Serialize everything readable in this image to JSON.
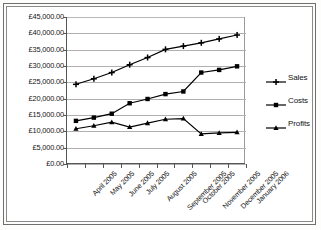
{
  "chart_data": {
    "type": "line",
    "title": "",
    "xlabel": "",
    "ylabel": "",
    "ylim": [
      0,
      45000
    ],
    "ytick_step": 5000,
    "grid": true,
    "legend_position": "right",
    "currency_symbol": "£",
    "categories": [
      "April 2005",
      "May 2005",
      "June 2005",
      "July 2005",
      "August 2005",
      "September 2005",
      "October 2005",
      "November 2005",
      "December 2005",
      "January 2006"
    ],
    "ytick_labels": [
      "£45,000.00",
      "£40,000.00",
      "£35,000.00",
      "£30,000.00",
      "£25,000.00",
      "£20,000.00",
      "£15,000.00",
      "£10,000.00",
      "£5,000.00",
      "£0.00"
    ],
    "ytick_values": [
      45000,
      40000,
      35000,
      30000,
      25000,
      20000,
      15000,
      10000,
      5000,
      0
    ],
    "series": [
      {
        "name": "Sales",
        "marker": "plus",
        "color": "#000000",
        "values": [
          24400,
          26100,
          28000,
          30400,
          32600,
          35100,
          36100,
          37100,
          38300,
          39500
        ]
      },
      {
        "name": "Costs",
        "marker": "square",
        "color": "#000000",
        "values": [
          13200,
          14200,
          15400,
          18600,
          19900,
          21400,
          22200,
          28000,
          28800,
          29900
        ]
      },
      {
        "name": "Profits",
        "marker": "triangle",
        "color": "#000000",
        "values": [
          10800,
          11700,
          12800,
          11300,
          12500,
          13700,
          13900,
          9200,
          9500,
          9700
        ]
      }
    ]
  },
  "legend": {
    "items": [
      {
        "label": "Sales",
        "marker": "plus"
      },
      {
        "label": "Costs",
        "marker": "square"
      },
      {
        "label": "Profits",
        "marker": "triangle"
      }
    ]
  }
}
